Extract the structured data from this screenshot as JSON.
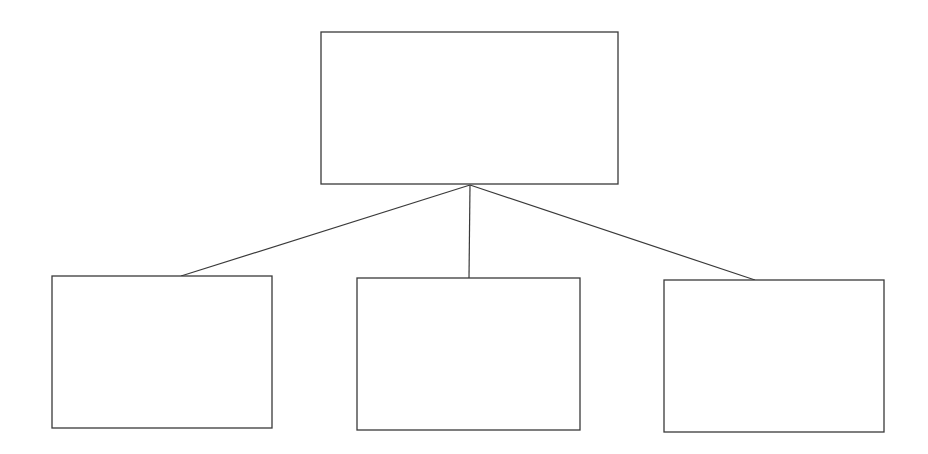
{
  "diagram": {
    "type": "hierarchy",
    "stroke_color": "#3a3a3a",
    "background": "#ffffff",
    "nodes": [
      {
        "id": "root",
        "label": "",
        "x": 321,
        "y": 32,
        "w": 297,
        "h": 152
      },
      {
        "id": "child-left",
        "label": "",
        "x": 52,
        "y": 276,
        "w": 220,
        "h": 152
      },
      {
        "id": "child-middle",
        "label": "",
        "x": 357,
        "y": 278,
        "w": 223,
        "h": 152
      },
      {
        "id": "child-right",
        "label": "",
        "x": 664,
        "y": 280,
        "w": 220,
        "h": 152
      }
    ],
    "edges": [
      {
        "from": "root",
        "to": "child-left",
        "x1": 470,
        "y1": 185,
        "x2": 181,
        "y2": 276
      },
      {
        "from": "root",
        "to": "child-middle",
        "x1": 470,
        "y1": 185,
        "x2": 469,
        "y2": 278
      },
      {
        "from": "root",
        "to": "child-right",
        "x1": 470,
        "y1": 185,
        "x2": 755,
        "y2": 280
      }
    ]
  }
}
